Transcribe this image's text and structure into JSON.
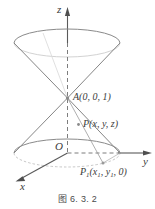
{
  "figure": {
    "caption": "图 6. 3. 2",
    "axes": {
      "z_label": "z",
      "y_label": "y",
      "x_label": "x",
      "origin_label": "O"
    },
    "points": [
      {
        "id": "apex",
        "name": "A",
        "label": "A(0, 0, 1)",
        "coords": "(0, 0, 1)"
      },
      {
        "id": "point-p",
        "name": "P",
        "label": "P(x, y, z)",
        "coords": "(x, y, z)"
      },
      {
        "id": "point-p1",
        "name": "P1",
        "label_main": "P",
        "label_sub": "1",
        "label_rest": "(x",
        "label_sub2": "1",
        "label_rest2": ", y",
        "label_sub3": "1",
        "label_rest3": ", 0)"
      }
    ],
    "colors": {
      "stroke": "#6e6e6e",
      "axis": "#5a5a5a",
      "text": "#3b3b3b",
      "background": "#ffffff",
      "marker": "#8a8a8a"
    },
    "shapes": {
      "top_ellipse": "upper cone rim",
      "bottom_ellipse": "lower cone rim",
      "cone_upper": "upper nappe",
      "cone_lower": "lower nappe"
    }
  }
}
